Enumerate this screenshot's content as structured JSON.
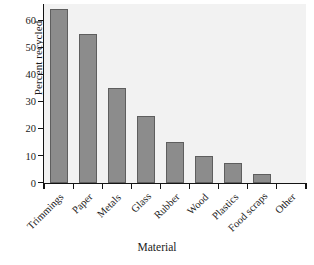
{
  "chart_data": {
    "type": "bar",
    "title": "",
    "xlabel": "Material",
    "ylabel": "Percent recycled",
    "categories": [
      "Trimmings",
      "Paper",
      "Metals",
      "Glass",
      "Rubber",
      "Wood",
      "Plastics",
      "Food scraps",
      "Other"
    ],
    "values": [
      64,
      55,
      35,
      24.5,
      15,
      10,
      7.3,
      3,
      0
    ],
    "ylim": [
      0,
      66
    ],
    "yticks": [
      0,
      10,
      20,
      30,
      40,
      50,
      60
    ],
    "ytick_labels": [
      "0",
      "10",
      "20",
      "30",
      "40",
      "50",
      "60"
    ],
    "grid": false,
    "legend": "none",
    "bar_color": "#8c8c8c",
    "bar_edge_color": "#5e5e5e",
    "plot_background": "#f2f2f2",
    "figure_background": "#ffffff",
    "axis_color": "#141414",
    "xtick_label_rotation": -45
  }
}
